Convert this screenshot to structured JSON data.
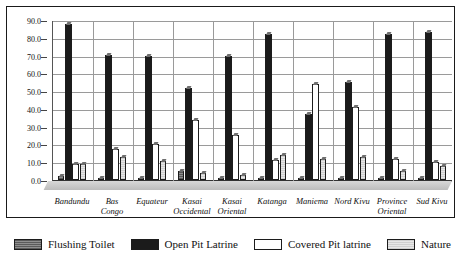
{
  "chart_data": {
    "type": "bar",
    "title": "",
    "xlabel": "",
    "ylabel": "",
    "ylim": [
      0.0,
      90.0
    ],
    "ytick_step": 10.0,
    "ytick_labels": [
      "0.0",
      "10.0",
      "20.0",
      "30.0",
      "40.0",
      "50.0",
      "60.0",
      "70.0",
      "80.0",
      "90.0"
    ],
    "grid": true,
    "legend_position": "bottom",
    "orientation": "vertical",
    "grouping": "clustered",
    "categories": [
      "Bandundu",
      "Bas Congo",
      "Equateur",
      "Kasai Occidental",
      "Kasai Oriental",
      "Katanga",
      "Maniema",
      "Nord Kivu",
      "Province Oriental",
      "Sud Kivu"
    ],
    "category_lines": [
      [
        "Bandundu",
        ""
      ],
      [
        "Bas",
        "Congo"
      ],
      [
        "Equateur",
        ""
      ],
      [
        "Kasai",
        "Occidental"
      ],
      [
        "Kasai",
        "Oriental"
      ],
      [
        "Katanga",
        ""
      ],
      [
        "Maniema",
        ""
      ],
      [
        "Nord Kivu",
        ""
      ],
      [
        "Province",
        "Oriental"
      ],
      [
        "Sud Kivu",
        ""
      ]
    ],
    "series": [
      {
        "name": "Flushing Toilet",
        "color": "#6e6e6e",
        "pattern": "horizontal-hatch",
        "values": [
          2.0,
          0.5,
          0.5,
          5.0,
          0.5,
          0.5,
          0.5,
          0.5,
          0.5,
          0.5
        ]
      },
      {
        "name": "Open Pit Latrine",
        "color": "#1b1b1b",
        "pattern": "solid",
        "values": [
          88.0,
          70.5,
          69.5,
          52.0,
          70.0,
          82.0,
          37.0,
          55.0,
          82.0,
          83.0
        ]
      },
      {
        "name": "Covered Pit latrine",
        "color": "#ffffff",
        "pattern": "none",
        "values": [
          9.0,
          17.5,
          20.5,
          34.0,
          25.5,
          11.5,
          54.0,
          41.0,
          12.0,
          10.0
        ]
      },
      {
        "name": "Nature",
        "color": "#d8d8d8",
        "pattern": "light-hatch",
        "values": [
          9.0,
          13.0,
          10.5,
          4.0,
          3.0,
          14.0,
          12.0,
          13.0,
          5.0,
          8.0
        ]
      }
    ]
  },
  "legend": {
    "items": [
      {
        "label": "Flushing Toilet",
        "swatch": "s0"
      },
      {
        "label": "Open Pit Latrine",
        "swatch": "s1"
      },
      {
        "label": "Covered Pit latrine",
        "swatch": "s2"
      },
      {
        "label": "Nature",
        "swatch": "s3"
      }
    ]
  }
}
